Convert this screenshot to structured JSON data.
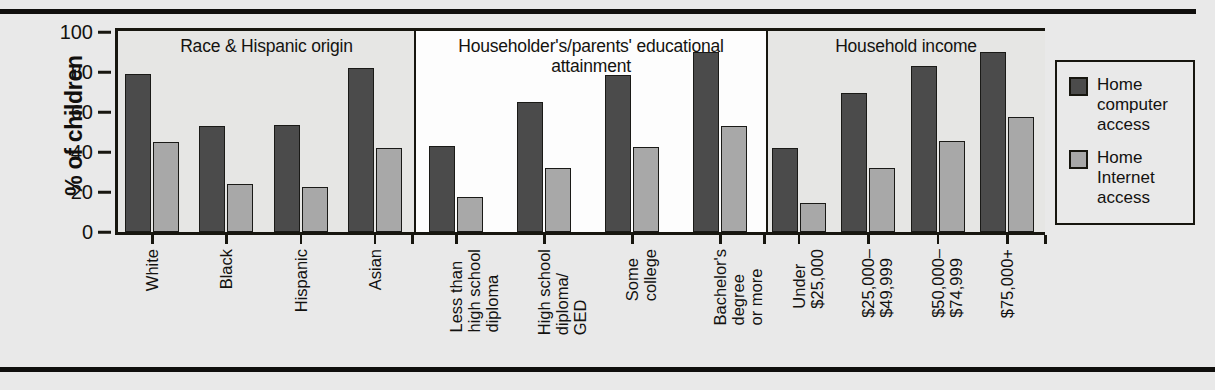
{
  "chart_data": {
    "type": "bar",
    "title": "",
    "xlabel": "",
    "ylabel": "% of children",
    "ylim": [
      0,
      100
    ],
    "yticks": [
      100,
      80,
      60,
      40,
      20,
      0
    ],
    "grid": false,
    "legend_position": "right",
    "series": [
      {
        "name": "Home computer access",
        "color": "#4b4b4b",
        "values": [
          79,
          53,
          53.5,
          82,
          43,
          65,
          78.5,
          90,
          42,
          69.5,
          83,
          90
        ]
      },
      {
        "name": "Home Internet access",
        "color": "#a8a8a8",
        "values": [
          45,
          24,
          22.5,
          42,
          17.5,
          32,
          42.5,
          53,
          14.5,
          32,
          45.5,
          57.5
        ]
      }
    ],
    "categories": [
      "White",
      "Black",
      "Hispanic",
      "Asian",
      "Less than high school diploma",
      "High school diploma/ GED",
      "Some college",
      "Bachelor's degree or more",
      "Under $25,000",
      "$25,000– $49,999",
      "$50,000– $74,999",
      "$75,000+"
    ],
    "groups": [
      {
        "title": "Race & Hispanic origin",
        "shade": "gray",
        "categories": [
          {
            "label": "White"
          },
          {
            "label": "Black"
          },
          {
            "label": "Hispanic"
          },
          {
            "label": "Asian"
          }
        ]
      },
      {
        "title": "Householder's/parents' educational\nattainment",
        "shade": "white",
        "categories": [
          {
            "label": "Less than\nhigh school\ndiploma"
          },
          {
            "label": "High school\ndiploma/\nGED"
          },
          {
            "label": "Some\ncollege"
          },
          {
            "label": "Bachelor's\ndegree\nor more"
          }
        ]
      },
      {
        "title": "Household income",
        "shade": "gray",
        "categories": [
          {
            "label": "Under\n$25,000"
          },
          {
            "label": "$25,000–\n$49,999"
          },
          {
            "label": "$50,000–\n$74,999"
          },
          {
            "label": "$75,000+"
          }
        ]
      }
    ]
  },
  "legend": {
    "items": [
      {
        "label": "Home\ncomputer\naccess",
        "series": "computer"
      },
      {
        "label": "Home\nInternet\naccess",
        "series": "internet"
      }
    ]
  },
  "colors": {
    "computer": "#4b4b4b",
    "internet": "#a8a8a8",
    "ink": "#17160f",
    "page": "#e9e9e9",
    "panel_white": "#fdfdfd",
    "panel_gray": "#e6e6e4"
  }
}
